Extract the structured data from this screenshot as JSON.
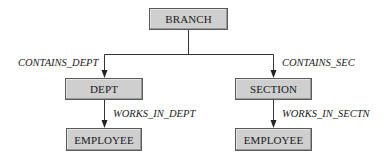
{
  "diagram": {
    "type": "hierarchy",
    "nodes": {
      "branch": "BRANCH",
      "dept": "DEPT",
      "section": "SECTION",
      "employee_dept": "EMPLOYEE",
      "employee_section": "EMPLOYEE"
    },
    "edges": {
      "contains_dept": "CONTAINS_DEPT",
      "contains_sec": "CONTAINS_SEC",
      "works_in_dept": "WORKS_IN_DEPT",
      "works_in_sectn": "WORKS_IN_SECTN"
    },
    "relationships": [
      {
        "from": "BRANCH",
        "to": "DEPT",
        "label": "CONTAINS_DEPT"
      },
      {
        "from": "BRANCH",
        "to": "SECTION",
        "label": "CONTAINS_SEC"
      },
      {
        "from": "DEPT",
        "to": "EMPLOYEE",
        "label": "WORKS_IN_DEPT"
      },
      {
        "from": "SECTION",
        "to": "EMPLOYEE",
        "label": "WORKS_IN_SECTN"
      }
    ],
    "colors": {
      "node_fill": "#cfcfcf",
      "node_border": "#5a5a5a",
      "line": "#333333"
    }
  }
}
